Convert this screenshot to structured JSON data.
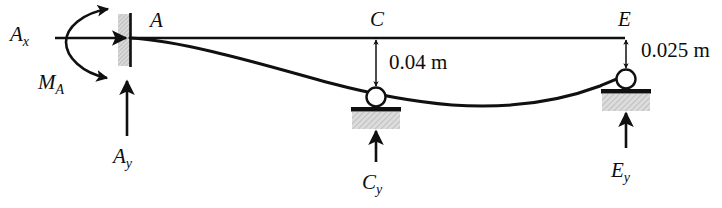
{
  "figure": {
    "type": "free-body-diagram",
    "colors": {
      "line": "#101010",
      "hatch_fill": "#d6d6d6",
      "background": "#ffffff"
    },
    "points": [
      {
        "id": "A",
        "label": "A",
        "x": 150,
        "y": 18
      },
      {
        "id": "C",
        "label": "C",
        "x": 372,
        "y": 17
      },
      {
        "id": "E",
        "label": "E",
        "x": 620,
        "y": 17
      }
    ],
    "reactions": [
      {
        "id": "Ax",
        "symbol": "A",
        "subscript": "x",
        "label": "A_x",
        "direction": "right",
        "x": 10,
        "y": 24
      },
      {
        "id": "MA",
        "symbol": "M",
        "subscript": "A",
        "label": "M_A",
        "direction": "moment",
        "x": 38,
        "y": 72
      },
      {
        "id": "Ay",
        "symbol": "A",
        "subscript": "y",
        "label": "A_y",
        "direction": "up",
        "x": 113,
        "y": 146
      },
      {
        "id": "Cy",
        "symbol": "C",
        "subscript": "y",
        "label": "C_y",
        "direction": "up",
        "x": 362,
        "y": 172
      },
      {
        "id": "Ey",
        "symbol": "E",
        "subscript": "y",
        "label": "E_y",
        "direction": "up",
        "x": 611,
        "y": 160
      }
    ],
    "dimensions": [
      {
        "id": "dim-C",
        "value": "0.04 m",
        "at_point": "C",
        "x": 389,
        "y": 53
      },
      {
        "id": "dim-E",
        "value": "0.025 m",
        "at_point": "E",
        "x": 641,
        "y": 41
      }
    ]
  }
}
